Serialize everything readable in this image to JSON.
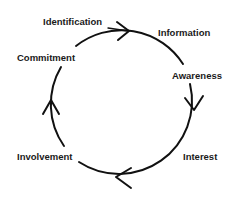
{
  "diagram": {
    "type": "cycle",
    "direction": "clockwise",
    "stages": [
      {
        "label": "Identification",
        "x": 43,
        "y": 17
      },
      {
        "label": "Information",
        "x": 158,
        "y": 28
      },
      {
        "label": "Awareness",
        "x": 172,
        "y": 71
      },
      {
        "label": "Interest",
        "x": 183,
        "y": 152
      },
      {
        "label": "Involvement",
        "x": 17,
        "y": 152
      },
      {
        "label": "Commitment",
        "x": 17,
        "y": 53
      }
    ],
    "colors": {
      "line": "#111111",
      "text": "#1a1a1a",
      "background": "#ffffff"
    }
  }
}
